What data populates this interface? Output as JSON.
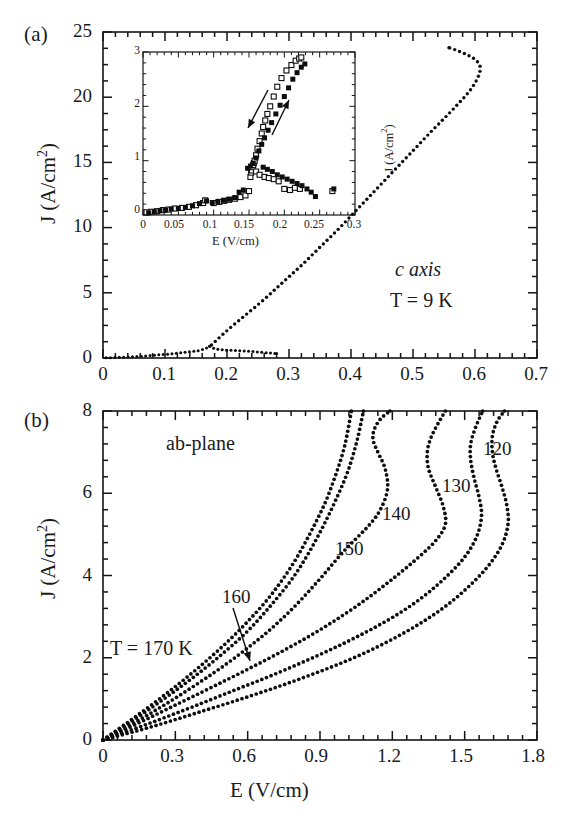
{
  "figure": {
    "width": 583,
    "height": 832,
    "background": "#ffffff",
    "ink_color": "#141414"
  },
  "panel_a": {
    "label": "(a)",
    "annotation_material": "c axis",
    "annotation_temperature": "T = 9 K",
    "xlabel": "",
    "ylabel": "J (A/cm",
    "ylabel_sup": "2",
    "ylabel_tail": ")",
    "x_ticks": [
      "0",
      "0.1",
      "0.2",
      "0.3",
      "0.4",
      "0.5",
      "0.6",
      "0.7"
    ],
    "y_ticks": [
      "0",
      "5",
      "10",
      "15",
      "20",
      "25"
    ]
  },
  "panel_b": {
    "label": "(b)",
    "annotation_plane": "ab-plane",
    "annotation_temperature": "T = 170 K",
    "xlabel": "E (V/cm)",
    "ylabel": "J (A/cm",
    "ylabel_sup": "2",
    "ylabel_tail": ")",
    "x_ticks": [
      "0",
      "0.3",
      "0.6",
      "0.9",
      "1.2",
      "1.5",
      "1.8"
    ],
    "y_ticks": [
      "0",
      "2",
      "4",
      "6",
      "8"
    ],
    "curve_labels": [
      "160",
      "150",
      "140",
      "130",
      "120"
    ]
  },
  "inset": {
    "xlabel": "E (V/cm)",
    "ylabel": "J (A/cm",
    "ylabel_sup": "2",
    "ylabel_tail": ")",
    "x_ticks": [
      "0",
      "0.05",
      "0.1",
      "0.15",
      "0.2",
      "0.25",
      "0.3"
    ],
    "y_ticks": [
      "0",
      "1",
      "2",
      "3"
    ]
  },
  "chart_data": [
    {
      "type": "scatter",
      "id": "panel-a-main",
      "title": "(a) c axis, T = 9 K",
      "xlabel": "E (V/cm)",
      "ylabel": "J (A/cm^2)",
      "xlim": [
        0,
        0.7
      ],
      "ylim": [
        0,
        25
      ],
      "xticks": [
        0,
        0.1,
        0.2,
        0.3,
        0.4,
        0.5,
        0.6,
        0.7
      ],
      "yticks": [
        0,
        5,
        10,
        15,
        20,
        25
      ],
      "grid": false,
      "legend": null,
      "annotations": [
        "c axis",
        "T = 9 K"
      ],
      "series": [
        {
          "name": "low-branch (increasing E, pre-switch)",
          "marker": "small filled dot",
          "x": [
            0.005,
            0.015,
            0.025,
            0.035,
            0.045,
            0.055,
            0.065,
            0.075,
            0.085,
            0.095,
            0.105,
            0.115,
            0.125,
            0.135,
            0.145,
            0.155,
            0.165,
            0.172
          ],
          "y": [
            0.02,
            0.03,
            0.05,
            0.07,
            0.09,
            0.12,
            0.15,
            0.18,
            0.22,
            0.26,
            0.3,
            0.35,
            0.4,
            0.45,
            0.5,
            0.58,
            0.72,
            0.9
          ]
        },
        {
          "name": "return branch (decreasing E, low-J plateau)",
          "marker": "small filled dot",
          "x": [
            0.172,
            0.18,
            0.19,
            0.2,
            0.21,
            0.22,
            0.23,
            0.24,
            0.25,
            0.26,
            0.27,
            0.28
          ],
          "y": [
            0.9,
            0.72,
            0.64,
            0.6,
            0.58,
            0.56,
            0.54,
            0.5,
            0.46,
            0.42,
            0.38,
            0.34
          ]
        },
        {
          "name": "high-branch (switched, NDR S-shape)",
          "marker": "small filled dot",
          "x": [
            0.175,
            0.2,
            0.23,
            0.26,
            0.29,
            0.32,
            0.35,
            0.38,
            0.41,
            0.44,
            0.47,
            0.5,
            0.53,
            0.555,
            0.575,
            0.59,
            0.6,
            0.607,
            0.608,
            0.6,
            0.585,
            0.57,
            0.558
          ],
          "y": [
            1.0,
            2.1,
            3.3,
            4.5,
            5.8,
            7.1,
            8.5,
            9.9,
            11.4,
            12.9,
            14.4,
            15.9,
            17.4,
            18.6,
            19.6,
            20.4,
            21.1,
            21.8,
            22.4,
            22.9,
            23.3,
            23.6,
            23.8
          ]
        }
      ]
    },
    {
      "type": "scatter",
      "id": "panel-a-inset",
      "title": "inset of (a): hysteretic switching region",
      "xlabel": "E (V/cm)",
      "ylabel": "J (A/cm^2)",
      "xlim": [
        0,
        0.3
      ],
      "ylim": [
        0,
        3
      ],
      "xticks": [
        0,
        0.05,
        0.1,
        0.15,
        0.2,
        0.25,
        0.3
      ],
      "yticks": [
        0,
        1,
        2,
        3
      ],
      "grid": false,
      "annotations": [
        "down-arrow (decreasing E sweep)",
        "up-arrow (increasing E sweep)"
      ],
      "series": [
        {
          "name": "open squares (sweep 1)",
          "marker": "open square",
          "x": [
            0.005,
            0.012,
            0.02,
            0.028,
            0.036,
            0.045,
            0.055,
            0.065,
            0.075,
            0.085,
            0.088,
            0.1,
            0.108,
            0.115,
            0.122,
            0.13,
            0.138,
            0.145,
            0.15,
            0.152,
            0.153,
            0.154,
            0.155,
            0.156,
            0.157,
            0.158,
            0.16,
            0.162,
            0.165,
            0.168,
            0.17,
            0.173,
            0.176,
            0.18,
            0.185,
            0.19,
            0.196,
            0.203,
            0.21,
            0.216,
            0.221,
            0.224,
            0.16,
            0.165,
            0.172,
            0.178,
            0.185,
            0.192,
            0.2,
            0.208,
            0.215,
            0.222,
            0.268
          ],
          "y": [
            0.05,
            0.06,
            0.07,
            0.09,
            0.1,
            0.12,
            0.13,
            0.15,
            0.18,
            0.22,
            0.27,
            0.22,
            0.24,
            0.26,
            0.28,
            0.3,
            0.33,
            0.36,
            0.44,
            0.7,
            0.78,
            0.82,
            0.88,
            0.92,
            0.96,
            1.0,
            1.1,
            1.22,
            1.36,
            1.5,
            1.62,
            1.74,
            1.86,
            2.0,
            2.18,
            2.36,
            2.52,
            2.66,
            2.76,
            2.84,
            2.88,
            2.9,
            0.8,
            0.74,
            0.7,
            0.68,
            0.66,
            0.62,
            0.48,
            0.46,
            0.5,
            0.48,
            0.44
          ]
        },
        {
          "name": "filled squares (sweep 2)",
          "marker": "filled square",
          "x": [
            0.008,
            0.016,
            0.024,
            0.032,
            0.04,
            0.05,
            0.06,
            0.07,
            0.08,
            0.09,
            0.098,
            0.106,
            0.114,
            0.122,
            0.13,
            0.136,
            0.142,
            0.148,
            0.152,
            0.156,
            0.16,
            0.164,
            0.168,
            0.172,
            0.177,
            0.182,
            0.188,
            0.194,
            0.2,
            0.206,
            0.212,
            0.218,
            0.224,
            0.229,
            0.17,
            0.176,
            0.183,
            0.19,
            0.197,
            0.204,
            0.211,
            0.218,
            0.225,
            0.232,
            0.238,
            0.244,
            0.27
          ],
          "y": [
            0.04,
            0.06,
            0.08,
            0.09,
            0.11,
            0.12,
            0.14,
            0.17,
            0.21,
            0.26,
            0.23,
            0.25,
            0.27,
            0.29,
            0.32,
            0.42,
            0.46,
            0.86,
            0.9,
            0.95,
            1.05,
            1.18,
            1.3,
            1.42,
            1.56,
            1.7,
            1.86,
            2.02,
            2.18,
            2.34,
            2.5,
            2.62,
            2.72,
            2.78,
            0.88,
            0.84,
            0.8,
            0.74,
            0.7,
            0.66,
            0.62,
            0.58,
            0.54,
            0.48,
            0.42,
            0.34,
            0.48
          ]
        }
      ]
    },
    {
      "type": "line",
      "id": "panel-b-main",
      "title": "(b) ab-plane",
      "xlabel": "E (V/cm)",
      "ylabel": "J (A/cm^2)",
      "xlim": [
        0,
        1.8
      ],
      "ylim": [
        0,
        8
      ],
      "xticks": [
        0,
        0.3,
        0.6,
        0.9,
        1.2,
        1.5,
        1.8
      ],
      "yticks": [
        0,
        2,
        4,
        6,
        8
      ],
      "grid": false,
      "annotations": [
        "ab-plane",
        "T = 170 K",
        "160 (with arrow)"
      ],
      "series": [
        {
          "name": "170 K",
          "label": "T = 170 K",
          "marker": "dotted",
          "x": [
            0.0,
            0.1,
            0.2,
            0.3,
            0.4,
            0.5,
            0.6,
            0.7,
            0.8,
            0.9,
            0.95,
            1.0,
            1.03
          ],
          "y": [
            0.0,
            0.42,
            0.85,
            1.3,
            1.78,
            2.3,
            2.88,
            3.55,
            4.4,
            5.5,
            6.2,
            7.1,
            8.0
          ]
        },
        {
          "name": "160 K",
          "label": "160",
          "marker": "dotted",
          "x": [
            0.0,
            0.1,
            0.2,
            0.3,
            0.4,
            0.5,
            0.6,
            0.7,
            0.8,
            0.9,
            1.0,
            1.05,
            1.08
          ],
          "y": [
            0.0,
            0.38,
            0.78,
            1.2,
            1.64,
            2.12,
            2.65,
            3.3,
            4.05,
            5.05,
            6.3,
            7.2,
            8.0
          ]
        },
        {
          "name": "150 K",
          "label": "150",
          "marker": "dotted",
          "x": [
            0.0,
            0.1,
            0.2,
            0.3,
            0.4,
            0.5,
            0.6,
            0.7,
            0.8,
            0.9,
            1.0,
            1.1,
            1.15,
            1.18,
            1.17,
            1.14,
            1.12,
            1.125,
            1.15,
            1.19
          ],
          "y": [
            0.0,
            0.32,
            0.66,
            1.02,
            1.4,
            1.8,
            2.24,
            2.72,
            3.28,
            3.92,
            4.6,
            5.2,
            5.6,
            6.1,
            6.6,
            7.0,
            7.3,
            7.55,
            7.8,
            8.0
          ]
        },
        {
          "name": "140 K",
          "label": "140",
          "marker": "dotted",
          "x": [
            0.0,
            0.15,
            0.3,
            0.45,
            0.6,
            0.75,
            0.9,
            1.05,
            1.18,
            1.3,
            1.38,
            1.42,
            1.41,
            1.38,
            1.35,
            1.345,
            1.36,
            1.39,
            1.42
          ],
          "y": [
            0.0,
            0.42,
            0.85,
            1.28,
            1.72,
            2.18,
            2.68,
            3.25,
            3.82,
            4.4,
            4.85,
            5.25,
            5.7,
            6.15,
            6.6,
            7.0,
            7.35,
            7.7,
            8.0
          ]
        },
        {
          "name": "130 K",
          "label": "130",
          "marker": "dotted",
          "x": [
            0.0,
            0.18,
            0.36,
            0.54,
            0.72,
            0.9,
            1.05,
            1.2,
            1.32,
            1.42,
            1.5,
            1.55,
            1.57,
            1.56,
            1.54,
            1.525,
            1.525,
            1.545,
            1.575
          ],
          "y": [
            0.0,
            0.38,
            0.78,
            1.2,
            1.62,
            2.08,
            2.5,
            2.98,
            3.45,
            3.95,
            4.45,
            4.95,
            5.45,
            5.9,
            6.35,
            6.8,
            7.2,
            7.6,
            8.0
          ]
        },
        {
          "name": "120 K",
          "label": "120",
          "marker": "dotted",
          "x": [
            0.0,
            0.2,
            0.4,
            0.6,
            0.8,
            1.0,
            1.15,
            1.3,
            1.42,
            1.52,
            1.6,
            1.655,
            1.68,
            1.675,
            1.655,
            1.63,
            1.615,
            1.615,
            1.635,
            1.665
          ],
          "y": [
            0.0,
            0.32,
            0.68,
            1.05,
            1.45,
            1.9,
            2.3,
            2.78,
            3.25,
            3.75,
            4.25,
            4.75,
            5.25,
            5.7,
            6.15,
            6.6,
            7.0,
            7.4,
            7.75,
            8.0
          ]
        }
      ]
    }
  ]
}
